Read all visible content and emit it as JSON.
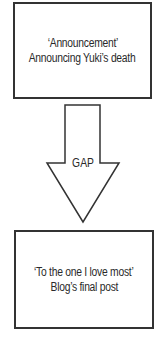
{
  "diagram": {
    "top_box": {
      "line1": "‘Announcement’",
      "line2": "Announcing Yuki’s death"
    },
    "arrow": {
      "label": "GAP",
      "direction": "down"
    },
    "bottom_box": {
      "line1": "‘To the one I love most’",
      "line2": "Blog’s final post"
    },
    "colors": {
      "stroke": "#333333",
      "text": "#2a2a2a",
      "background": "#ffffff"
    }
  }
}
